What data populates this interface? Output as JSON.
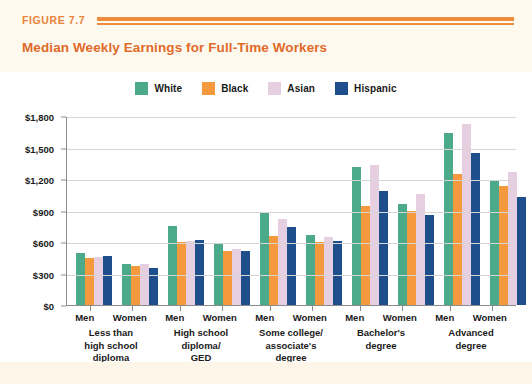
{
  "header": {
    "figure_label": "FIGURE 7.7",
    "title": "Median Weekly Earnings for Full-Time Workers"
  },
  "colors": {
    "white_series": "#4aaa8a",
    "black_series": "#f5993f",
    "asian_series": "#e5cfe0",
    "hispanic_series": "#1f4e8c",
    "accent_orange": "#ef8b3c",
    "title_orange": "#e06a2a",
    "gridline": "#d6d6d6",
    "axis": "#8b8b8b",
    "panel_background": "#ffffff",
    "page_background": "#fdfaf0"
  },
  "chart_data": {
    "type": "bar",
    "title": "Median Weekly Earnings for Full-Time Workers",
    "xlabel": "",
    "ylabel": "",
    "ylim": [
      0,
      1800
    ],
    "ytick_labels": [
      "$1,800",
      "$1,500",
      "$1,200",
      "$900",
      "$600",
      "$300",
      "$0"
    ],
    "ytick_values": [
      1800,
      1500,
      1200,
      900,
      600,
      300,
      0
    ],
    "grid": true,
    "legend_position": "top-center",
    "legend": [
      "White",
      "Black",
      "Asian",
      "Hispanic"
    ],
    "categories": [
      "Less than\nhigh school\ndiploma",
      "High school\ndiploma/\nGED",
      "Some college/\nassociate's\ndegree",
      "Bachelor's\ndegree",
      "Advanced\ndegree"
    ],
    "subcategories": [
      "Men",
      "Women"
    ],
    "groups": [
      {
        "education": "Less than\nhigh school\ndiploma",
        "sexes": [
          {
            "sex": "Men",
            "values": [
              500,
              450,
              455,
              470
            ]
          },
          {
            "sex": "Women",
            "values": [
              390,
              375,
              390,
              355
            ]
          }
        ]
      },
      {
        "education": "High school\ndiploma/\nGED",
        "sexes": [
          {
            "sex": "Men",
            "values": [
              750,
              600,
              610,
              615
            ]
          },
          {
            "sex": "Women",
            "values": [
              595,
              510,
              530,
              510
            ]
          }
        ]
      },
      {
        "education": "Some college/\nassociate's\ndegree",
        "sexes": [
          {
            "sex": "Men",
            "values": [
              890,
              660,
              820,
              745
            ]
          },
          {
            "sex": "Women",
            "values": [
              665,
              600,
              650,
              610
            ]
          }
        ]
      },
      {
        "education": "Bachelor's\ndegree",
        "sexes": [
          {
            "sex": "Men",
            "values": [
              1310,
              945,
              1330,
              1090
            ]
          },
          {
            "sex": "Women",
            "values": [
              965,
              900,
              1060,
              860
            ]
          }
        ]
      },
      {
        "education": "Advanced\ndegree",
        "sexes": [
          {
            "sex": "Men",
            "values": [
              1640,
              1250,
              1720,
              1450
            ]
          },
          {
            "sex": "Women",
            "values": [
              1180,
              1130,
              1270,
              1030
            ]
          }
        ]
      }
    ]
  }
}
